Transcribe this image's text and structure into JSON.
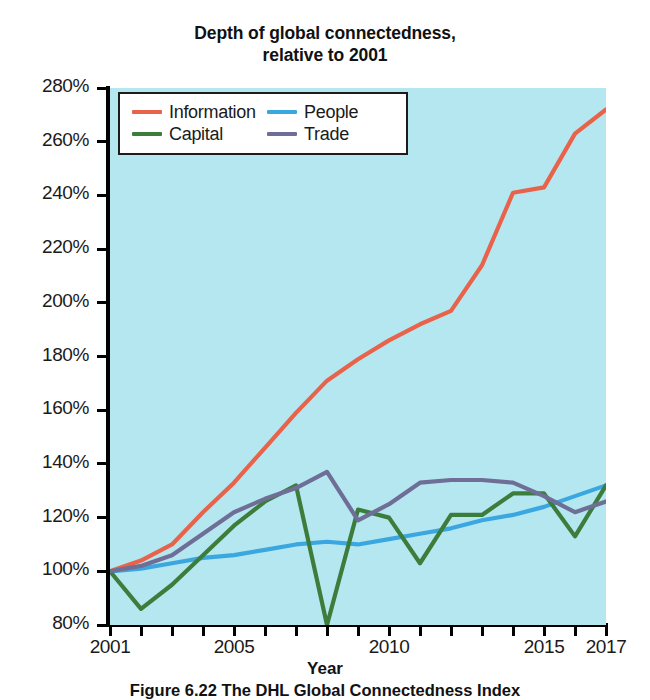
{
  "title": {
    "line1": "Depth of global connectedness,",
    "line2": "relative to 2001"
  },
  "caption": "Figure 6.22 The DHL Global Connectedness Index",
  "legend": {
    "position": "upper-left-inside",
    "items": [
      {
        "label": "Information",
        "color": "#E8634A"
      },
      {
        "label": "People",
        "color": "#3BA7E0"
      },
      {
        "label": "Capital",
        "color": "#3C7D3C"
      },
      {
        "label": "Trade",
        "color": "#6E6E96"
      }
    ]
  },
  "colors": {
    "plot_background": "#b5e7f0",
    "page_background": "#ffffff",
    "axis": "#000000",
    "information": "#E8634A",
    "people": "#3BA7E0",
    "capital": "#3C7D3C",
    "trade": "#6E6E96"
  },
  "chart_data": {
    "type": "line",
    "title": "Depth of global connectedness, relative to 2001",
    "xlabel": "Year",
    "ylabel": "",
    "xlim": [
      2001,
      2017
    ],
    "ylim": [
      80,
      280
    ],
    "ytick_labels": [
      "80%",
      "100%",
      "120%",
      "140%",
      "160%",
      "180%",
      "200%",
      "220%",
      "240%",
      "260%",
      "280%"
    ],
    "ytick_values": [
      80,
      100,
      120,
      140,
      160,
      180,
      200,
      220,
      240,
      260,
      280
    ],
    "xtick_values": [
      2001,
      2002,
      2003,
      2004,
      2005,
      2006,
      2007,
      2008,
      2009,
      2010,
      2011,
      2012,
      2013,
      2014,
      2015,
      2016,
      2017
    ],
    "xtick_labels_shown": [
      "2001",
      "2005",
      "2010",
      "2015",
      "2017"
    ],
    "xtick_labels_shown_values": [
      2001,
      2005,
      2010,
      2015,
      2017
    ],
    "grid": false,
    "legend_position": "upper left",
    "x": [
      2001,
      2002,
      2003,
      2004,
      2005,
      2006,
      2007,
      2008,
      2009,
      2010,
      2011,
      2012,
      2013,
      2014,
      2015,
      2016,
      2017
    ],
    "series": [
      {
        "name": "Information",
        "color": "#E8634A",
        "values": [
          100,
          104,
          110,
          122,
          133,
          146,
          159,
          171,
          179,
          186,
          192,
          197,
          214,
          241,
          243,
          263,
          272
        ]
      },
      {
        "name": "People",
        "color": "#3BA7E0",
        "values": [
          100,
          101,
          103,
          105,
          106,
          108,
          110,
          111,
          110,
          112,
          114,
          116,
          119,
          121,
          124,
          128,
          132
        ]
      },
      {
        "name": "Capital",
        "color": "#3C7D3C",
        "values": [
          100,
          86,
          95,
          106,
          117,
          126,
          132,
          80,
          123,
          120,
          103,
          121,
          121,
          129,
          129,
          113,
          132
        ]
      },
      {
        "name": "Trade",
        "color": "#6E6E96",
        "values": [
          100,
          102,
          106,
          114,
          122,
          127,
          131,
          137,
          119,
          125,
          133,
          134,
          134,
          133,
          128,
          122,
          126
        ]
      }
    ]
  }
}
